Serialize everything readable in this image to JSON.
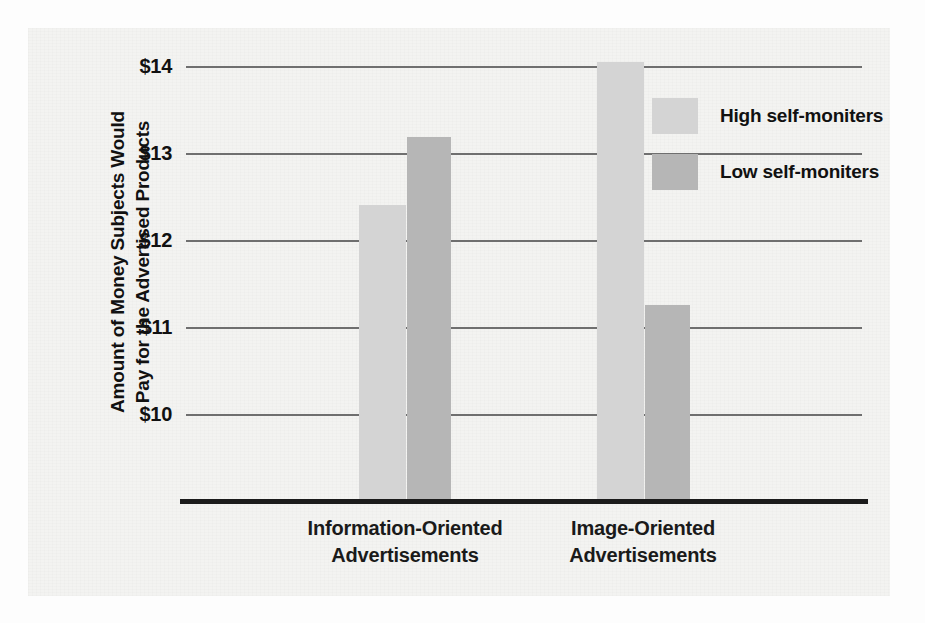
{
  "chart_data": {
    "type": "bar",
    "title": "",
    "xlabel": "",
    "ylabel": "Amount of Money Subjects Would Pay for the Advertised Products",
    "ylabel_lines": [
      "Amount of Money Subjects Would",
      "Pay for the Advertised Products"
    ],
    "categories": [
      "Information-Oriented Advertisements",
      "Image-Oriented Advertisements"
    ],
    "category_lines": [
      [
        "Information-Oriented",
        "Advertisements"
      ],
      [
        "Image-Oriented",
        "Advertisements"
      ]
    ],
    "series": [
      {
        "name": "High self-moniters",
        "values": [
          12.4,
          14.05
        ],
        "color": "#d4d4d4"
      },
      {
        "name": "Low self-moniters",
        "values": [
          13.18,
          11.25
        ],
        "color": "#b6b6b6"
      }
    ],
    "ylim": [
      9.03,
      14.0
    ],
    "yticks": [
      14,
      13,
      12,
      11,
      10
    ],
    "ytick_labels": [
      "$14",
      "$13",
      "$12",
      "$11",
      "$10"
    ],
    "grid": true,
    "legend_position": "upper-right",
    "axis_color": "#1b1b1b",
    "gridline_color": "#6f6f6f"
  },
  "legend": {
    "items": [
      {
        "label": "High self-moniters",
        "swatch": "#d4d4d4"
      },
      {
        "label": "Low self-moniters",
        "swatch": "#b6b6b6"
      }
    ]
  }
}
